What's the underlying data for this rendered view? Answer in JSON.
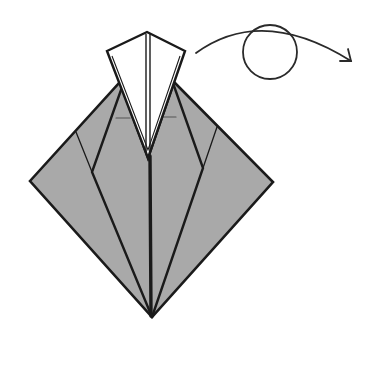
{
  "diagram": {
    "type": "origami-step",
    "colors": {
      "paper_back": "#a9a9a9",
      "paper_front": "#ffffff",
      "line": "#1a1a1a",
      "arrow": "#2a2a2a"
    },
    "symbols": [
      {
        "name": "turn-over",
        "shape": "arc-arrow-with-circle"
      }
    ],
    "geometry": {
      "diamond": {
        "left": [
          30,
          181
        ],
        "top_left": [
          120,
          82
        ],
        "top_right": [
          174,
          82
        ],
        "right": [
          273,
          182
        ],
        "bottom": [
          152,
          317
        ]
      },
      "flap": {
        "apex": [
          147,
          32
        ],
        "left": [
          107,
          51
        ],
        "right": [
          185,
          51
        ],
        "tip": [
          148,
          158
        ]
      },
      "circle": {
        "cx": 270,
        "cy": 52,
        "r": 27
      }
    }
  }
}
